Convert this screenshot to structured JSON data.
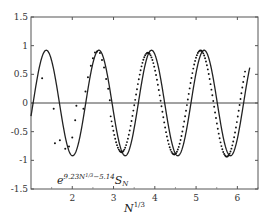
{
  "chart_data": {
    "type": "line",
    "title": "",
    "xlabel": "N^{1/3}",
    "ylabel": "",
    "xlim": [
      1.0,
      6.5
    ],
    "ylim": [
      -1.5,
      1.5
    ],
    "grid": false,
    "xticks": [
      2,
      3,
      4,
      5,
      6
    ],
    "yticks": [
      1.5,
      1,
      0.5,
      0,
      -0.5,
      -1,
      -1.5
    ],
    "xtick_labels": [
      "2",
      "3",
      "4",
      "5",
      "6"
    ],
    "ytick_labels": [
      "1.5",
      "1",
      "0.5",
      "0",
      "-0.5",
      "-1",
      "-1.5"
    ],
    "annotation": {
      "text_base": "e",
      "text_exp": "9.23N",
      "text_exp_sup": "1/3",
      "text_exp_tail": "−5.14",
      "text_tail": "S",
      "text_tail_sub": "N",
      "x": 2.0,
      "y": -1.05
    },
    "series": [
      {
        "name": "asymptotic curve",
        "style": "solid",
        "color": "#222222",
        "model": {
          "amplitude": 0.92,
          "period": 1.275,
          "peak_x": 1.37
        },
        "x_range": [
          1.0,
          6.3
        ]
      },
      {
        "name": "e^{9.23N^{1/3}-5.14} S_N (data)",
        "style": "dots",
        "color": "#111111",
        "points": [
          [
            1.27,
            0.43
          ],
          [
            1.55,
            -0.1
          ],
          [
            1.58,
            -0.7
          ],
          [
            1.7,
            -0.65
          ],
          [
            1.83,
            -0.8
          ],
          [
            1.92,
            -0.76
          ],
          [
            2.0,
            -0.6
          ],
          [
            2.07,
            -0.3
          ],
          [
            2.1,
            -0.05
          ],
          [
            2.27,
            -0.1
          ],
          [
            2.32,
            0.2
          ],
          [
            2.38,
            0.45
          ],
          [
            2.45,
            0.65
          ],
          [
            2.5,
            0.78
          ],
          [
            2.55,
            0.88
          ],
          [
            2.6,
            0.9
          ],
          [
            2.67,
            0.87
          ],
          [
            2.72,
            0.75
          ],
          [
            2.77,
            0.62
          ],
          [
            2.82,
            0.42
          ],
          [
            2.87,
            0.25
          ],
          [
            2.91,
            0.05
          ]
        ],
        "dense_model": {
          "amplitude_start": 0.85,
          "amplitude_end": 0.95,
          "period": 1.275,
          "peak_x_offset": -0.09,
          "x_range": [
            2.93,
            6.2
          ]
        }
      }
    ]
  }
}
